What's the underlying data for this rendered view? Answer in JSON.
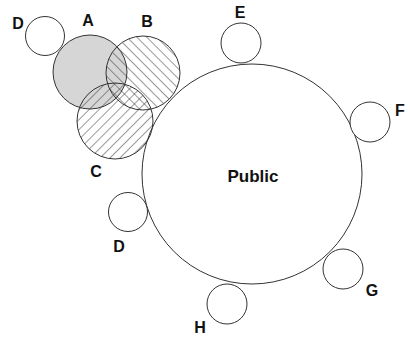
{
  "diagram": {
    "title": "",
    "central": {
      "label": "Public"
    },
    "overlapping_sets": [
      {
        "id": "A",
        "label": "A",
        "fill": "shaded-gray",
        "color": "#d6d6d6"
      },
      {
        "id": "B",
        "label": "B",
        "fill": "hatch-forward"
      },
      {
        "id": "C",
        "label": "C",
        "fill": "hatch-backward"
      }
    ],
    "satellites": [
      {
        "id": "D1",
        "label": "D"
      },
      {
        "id": "E",
        "label": "E"
      },
      {
        "id": "F",
        "label": "F"
      },
      {
        "id": "D2",
        "label": "D"
      },
      {
        "id": "G",
        "label": "G"
      },
      {
        "id": "H",
        "label": "H"
      }
    ],
    "colors": {
      "stroke": "#333333",
      "shade": "#d6d6d6",
      "text": "#111111",
      "background": "#ffffff"
    }
  }
}
